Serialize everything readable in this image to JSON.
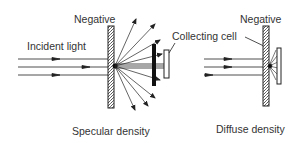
{
  "diagram": {
    "specular": {
      "negative_label": "Negative",
      "incident_label": "Incident light",
      "collecting_cell_label": "Collecting cell",
      "caption": "Specular density"
    },
    "diffuse": {
      "negative_label": "Negative",
      "caption": "Diffuse density"
    },
    "colors": {
      "ink": "#222222",
      "text": "#333333",
      "background": "#ffffff"
    }
  }
}
